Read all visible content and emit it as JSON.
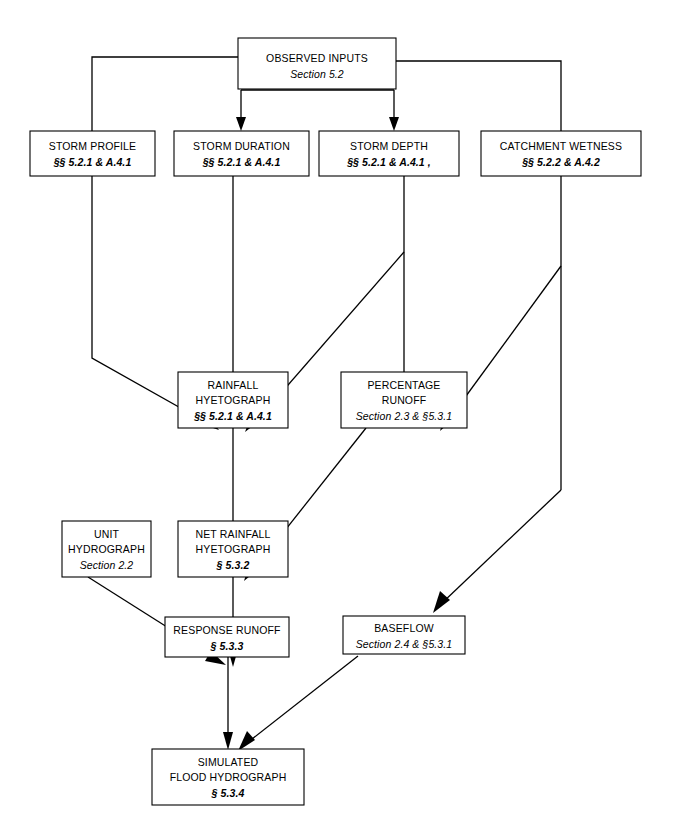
{
  "diagram": {
    "type": "flowchart",
    "background_color": "#ffffff",
    "line_color": "#000000",
    "box_fill": "#ffffff"
  },
  "nodes": {
    "observed_inputs": {
      "id": "observed-inputs",
      "lines": [
        "OBSERVED INPUTS"
      ],
      "reference": "Section 5.2",
      "x": 238,
      "y": 38,
      "w": 158,
      "h": 51
    },
    "storm_profile": {
      "id": "storm-profile",
      "lines": [
        "STORM PROFILE"
      ],
      "reference": "§§ 5.2.1 & A.4.1",
      "x": 30,
      "y": 131,
      "w": 125,
      "h": 45
    },
    "storm_duration": {
      "id": "storm-duration",
      "lines": [
        "STORM DURATION"
      ],
      "reference": "§§ 5.2.1 & A.4.1",
      "x": 174,
      "y": 131,
      "w": 135,
      "h": 45
    },
    "storm_depth": {
      "id": "storm-depth",
      "lines": [
        "STORM DEPTH"
      ],
      "reference": "§§ 5.2.1 & A.4.1 ,",
      "x": 319,
      "y": 131,
      "w": 140,
      "h": 45
    },
    "catchment_wetness": {
      "id": "catchment-wetness",
      "lines": [
        "CATCHMENT WETNESS"
      ],
      "reference": "§§ 5.2.2 & A.4.2",
      "x": 481,
      "y": 131,
      "w": 160,
      "h": 45
    },
    "rainfall_hyetograph": {
      "id": "rainfall-hyetograph",
      "lines": [
        "RAINFALL",
        "HYETOGRAPH"
      ],
      "reference": "§§ 5.2.1 & A.4.1",
      "x": 178,
      "y": 372,
      "w": 110,
      "h": 56
    },
    "percentage_runoff": {
      "id": "percentage-runoff",
      "lines": [
        "PERCENTAGE",
        "RUNOFF"
      ],
      "reference": "Section 2.3 & §5.3.1",
      "x": 341,
      "y": 372,
      "w": 126,
      "h": 56
    },
    "unit_hydrograph": {
      "id": "unit-hydrograph",
      "lines": [
        "UNIT",
        "HYDROGRAPH"
      ],
      "reference": "Section 2.2",
      "x": 62,
      "y": 521,
      "w": 89,
      "h": 56
    },
    "net_rainfall_hyetograph": {
      "id": "net-rainfall-hyetograph",
      "lines": [
        "NET RAINFALL",
        "HYETOGRAPH"
      ],
      "reference": "§ 5.3.2",
      "x": 178,
      "y": 521,
      "w": 110,
      "h": 56
    },
    "response_runoff": {
      "id": "response-runoff",
      "lines": [
        "RESPONSE RUNOFF"
      ],
      "reference": "§ 5.3.3",
      "x": 165,
      "y": 617,
      "w": 124,
      "h": 40
    },
    "baseflow": {
      "id": "baseflow",
      "lines": [
        "BASEFLOW"
      ],
      "reference": "Section 2.4 &  §5.3.1",
      "x": 343,
      "y": 616,
      "w": 122,
      "h": 38
    },
    "simulated_flood_hydrograph": {
      "id": "simulated-flood-hydrograph",
      "lines": [
        "SIMULATED",
        "FLOOD HYDROGRAPH"
      ],
      "reference": "§ 5.3.4",
      "x": 152,
      "y": 749,
      "w": 152,
      "h": 56
    }
  },
  "edges": [
    {
      "from": "observed_inputs",
      "to": "storm_profile",
      "name": "edge-observed-to-storm-profile"
    },
    {
      "from": "observed_inputs",
      "to": "storm_duration",
      "name": "edge-observed-to-storm-duration"
    },
    {
      "from": "observed_inputs",
      "to": "storm_depth",
      "name": "edge-observed-to-storm-depth"
    },
    {
      "from": "observed_inputs",
      "to": "catchment_wetness",
      "name": "edge-observed-to-catchment-wetness"
    },
    {
      "from": "storm_profile",
      "to": "rainfall_hyetograph",
      "name": "edge-storm-profile-to-rainfall-hyetograph"
    },
    {
      "from": "storm_duration",
      "to": "rainfall_hyetograph",
      "name": "edge-storm-duration-to-rainfall-hyetograph"
    },
    {
      "from": "storm_depth",
      "to": "rainfall_hyetograph",
      "name": "edge-storm-depth-to-rainfall-hyetograph"
    },
    {
      "from": "storm_depth",
      "to": "percentage_runoff",
      "name": "edge-storm-depth-to-percentage-runoff"
    },
    {
      "from": "catchment_wetness",
      "to": "percentage_runoff",
      "name": "edge-catchment-wetness-to-percentage-runoff"
    },
    {
      "from": "catchment_wetness",
      "to": "baseflow",
      "name": "edge-catchment-wetness-to-baseflow"
    },
    {
      "from": "rainfall_hyetograph",
      "to": "net_rainfall_hyetograph",
      "name": "edge-rainfall-to-net-rainfall"
    },
    {
      "from": "percentage_runoff",
      "to": "net_rainfall_hyetograph",
      "name": "edge-percentage-runoff-to-net-rainfall"
    },
    {
      "from": "unit_hydrograph",
      "to": "response_runoff",
      "name": "edge-unit-hydrograph-to-response-runoff"
    },
    {
      "from": "net_rainfall_hyetograph",
      "to": "response_runoff",
      "name": "edge-net-rainfall-to-response-runoff"
    },
    {
      "from": "response_runoff",
      "to": "simulated_flood_hydrograph",
      "name": "edge-response-runoff-to-simulated-flood"
    },
    {
      "from": "baseflow",
      "to": "simulated_flood_hydrograph",
      "name": "edge-baseflow-to-simulated-flood"
    }
  ]
}
